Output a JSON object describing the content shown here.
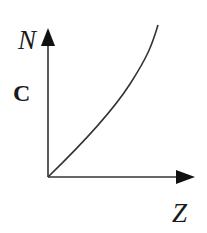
{
  "diagram": {
    "y_axis_label": "N",
    "x_axis_label": "Z",
    "panel_label": "C",
    "curve_description": "concave-up increasing curve starting at origin",
    "colors": {
      "line": "#222222",
      "background": "#ffffff"
    }
  }
}
